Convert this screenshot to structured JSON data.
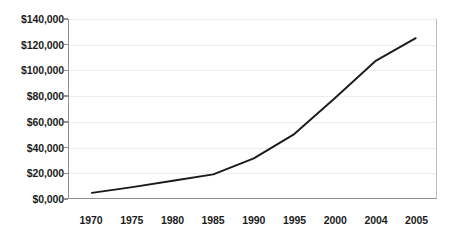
{
  "chart_data": {
    "type": "line",
    "title": "",
    "subtitle": "",
    "xlabel": "",
    "ylabel": "",
    "x": [
      1970,
      1975,
      1980,
      1985,
      1990,
      1995,
      2000,
      2004,
      2005
    ],
    "categories": [
      "1970",
      "1975",
      "1980",
      "1985",
      "1990",
      "1995",
      "2000",
      "2004",
      "2005"
    ],
    "values": [
      4000,
      8500,
      13500,
      18500,
      31000,
      50000,
      78000,
      107000,
      125000
    ],
    "series": [
      {
        "name": "",
        "values": [
          4000,
          8500,
          13500,
          18500,
          31000,
          50000,
          78000,
          107000,
          125000
        ]
      }
    ],
    "ylim": [
      0,
      140000
    ],
    "ytick_values": [
      0,
      20000,
      40000,
      60000,
      80000,
      100000,
      120000,
      140000
    ],
    "ytick_labels": [
      "$0,000",
      "$20,000",
      "$40,000",
      "$60,000",
      "$80,000",
      "$100,000",
      "$120,000",
      "$140,000"
    ],
    "xtick_labels": [
      "1970",
      "1975",
      "1980",
      "1985",
      "1990",
      "1995",
      "2000",
      "2004",
      "2005"
    ],
    "grid": true,
    "grid_axis": "y",
    "legend": false,
    "legend_position": "none",
    "line_color": "#1a1a1a",
    "grid_color": "#ededed",
    "axis_color": "#8f8f8f",
    "background_color": "#ffffff",
    "markers": false,
    "annotations": []
  }
}
